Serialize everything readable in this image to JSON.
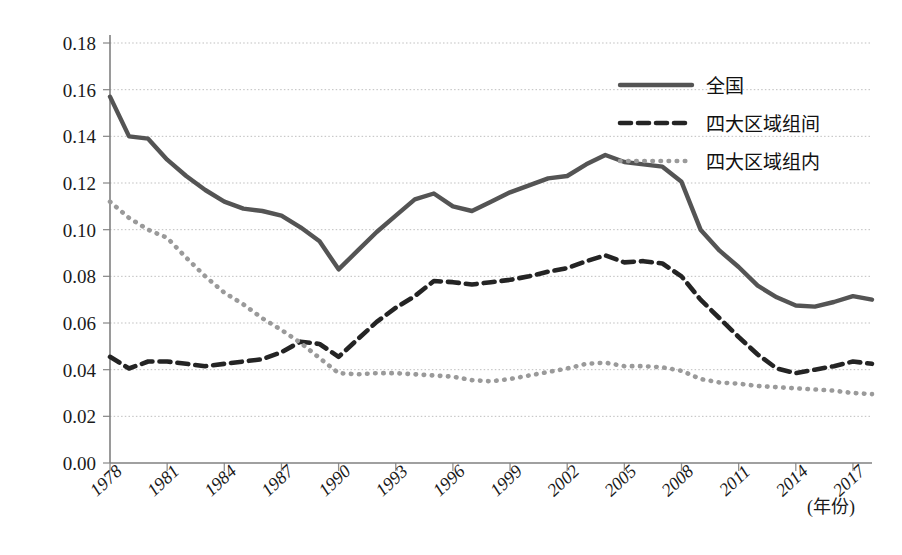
{
  "chart_data": {
    "type": "line",
    "title": "",
    "xlabel": "(年份)",
    "ylabel": "",
    "ylim": [
      0.0,
      0.18
    ],
    "ytick_labels": [
      "0.00",
      "0.02",
      "0.04",
      "0.06",
      "0.08",
      "0.10",
      "0.12",
      "0.14",
      "0.16",
      "0.18"
    ],
    "ytick_values": [
      0.0,
      0.02,
      0.04,
      0.06,
      0.08,
      0.1,
      0.12,
      0.14,
      0.16,
      0.18
    ],
    "xtick_labels": [
      "1978",
      "1981",
      "1984",
      "1987",
      "1990",
      "1993",
      "1996",
      "1999",
      "2002",
      "2005",
      "2008",
      "2011",
      "2014",
      "2017"
    ],
    "xtick_values": [
      1978,
      1981,
      1984,
      1987,
      1990,
      1993,
      1996,
      1999,
      2002,
      2005,
      2008,
      2011,
      2014,
      2017
    ],
    "xlim": [
      1978,
      2018
    ],
    "grid": true,
    "legend_position": "top-right",
    "x": [
      1978,
      1979,
      1980,
      1981,
      1982,
      1983,
      1984,
      1985,
      1986,
      1987,
      1988,
      1989,
      1990,
      1991,
      1992,
      1993,
      1994,
      1995,
      1996,
      1997,
      1998,
      1999,
      2000,
      2001,
      2002,
      2003,
      2004,
      2005,
      2006,
      2007,
      2008,
      2009,
      2010,
      2011,
      2012,
      2013,
      2014,
      2015,
      2016,
      2017,
      2018
    ],
    "series": [
      {
        "name": "全国",
        "style": "solid",
        "color": "#545454",
        "values": [
          0.157,
          0.14,
          0.139,
          0.13,
          0.123,
          0.117,
          0.112,
          0.109,
          0.108,
          0.106,
          0.101,
          0.095,
          0.083,
          0.091,
          0.099,
          0.106,
          0.113,
          0.1155,
          0.11,
          0.108,
          0.112,
          0.116,
          0.119,
          0.122,
          0.123,
          0.128,
          0.132,
          0.129,
          0.128,
          0.127,
          0.1205,
          0.1,
          0.091,
          0.084,
          0.076,
          0.071,
          0.0675,
          0.067,
          0.069,
          0.0715,
          0.07
        ]
      },
      {
        "name": "四大区域组间",
        "style": "dashed",
        "color": "#242424",
        "values": [
          0.0455,
          0.0405,
          0.0435,
          0.0435,
          0.0425,
          0.0415,
          0.0425,
          0.0435,
          0.0445,
          0.0475,
          0.052,
          0.051,
          0.0455,
          0.053,
          0.0605,
          0.0665,
          0.0715,
          0.078,
          0.0775,
          0.0765,
          0.0775,
          0.0785,
          0.08,
          0.082,
          0.0835,
          0.0865,
          0.089,
          0.086,
          0.0865,
          0.0855,
          0.08,
          0.07,
          0.062,
          0.054,
          0.0465,
          0.0405,
          0.0385,
          0.04,
          0.0415,
          0.0435,
          0.0425
        ]
      },
      {
        "name": "四大区域组内",
        "style": "dotted",
        "color": "#9a9a9a",
        "values": [
          0.112,
          0.105,
          0.1,
          0.0965,
          0.088,
          0.08,
          0.073,
          0.068,
          0.062,
          0.057,
          0.0515,
          0.045,
          0.0385,
          0.038,
          0.0385,
          0.0385,
          0.038,
          0.0375,
          0.037,
          0.0355,
          0.035,
          0.036,
          0.0375,
          0.039,
          0.0405,
          0.0425,
          0.043,
          0.0415,
          0.0415,
          0.041,
          0.0395,
          0.036,
          0.0345,
          0.034,
          0.033,
          0.0325,
          0.032,
          0.0315,
          0.031,
          0.03,
          0.0295
        ]
      }
    ]
  },
  "legend": {
    "items": [
      {
        "label": "全国",
        "style": "solid"
      },
      {
        "label": "四大区域组间",
        "style": "dashed"
      },
      {
        "label": "四大区域组内",
        "style": "dotted"
      }
    ]
  }
}
